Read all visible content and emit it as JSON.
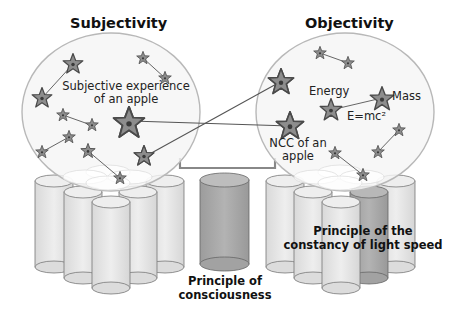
{
  "titles": {
    "left": "Subjectivity",
    "right": "Objectivity"
  },
  "left_sphere": {
    "label_line1": "Subjective experience",
    "label_line2": "of an apple"
  },
  "right_sphere": {
    "energy": "Energy",
    "mass": "Mass",
    "equation": "E=mc²",
    "ncc_line1": "NCC of an",
    "ncc_line2": "apple"
  },
  "bottom_labels": {
    "consciousness_line1": "Principle of",
    "consciousness_line2": "consciousness",
    "light_line1": "Principle of the",
    "light_line2": "constancy of light speed"
  },
  "colors": {
    "sphere_outline": "#b5b5b5",
    "sphere_fill": "#f6f6f6",
    "star_fill": "#8d8d8d",
    "star_stroke": "#4a4a4a",
    "cylinder_light": "#e6e6e6",
    "cylinder_dark": "#a9a9a9",
    "line": "#555555"
  }
}
